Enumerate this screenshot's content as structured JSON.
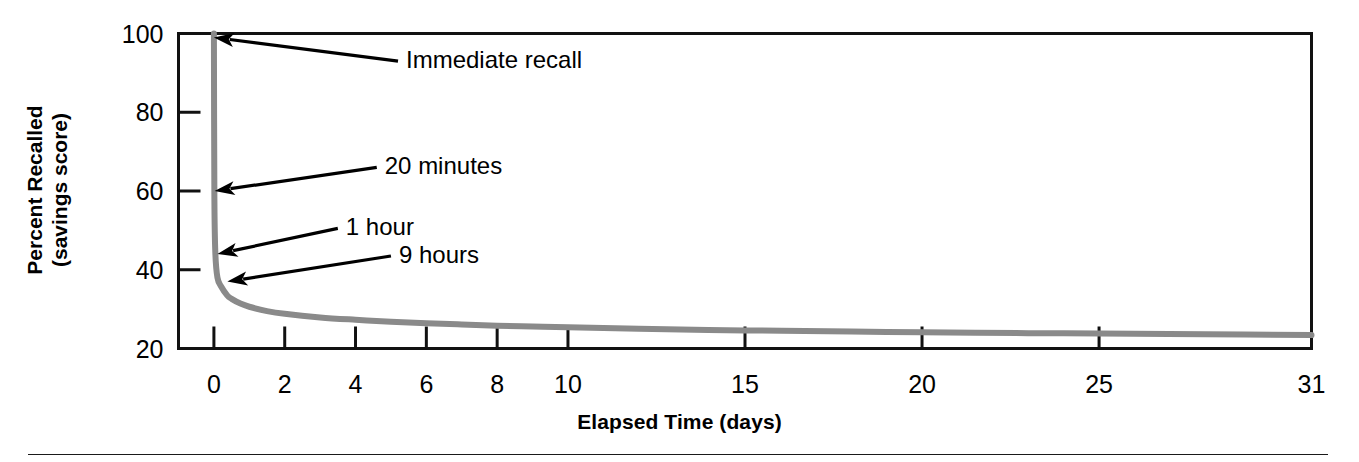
{
  "figure": {
    "name": "ebbinghaus-forgetting-curve",
    "background": "#ffffff",
    "axis_color": "#111111",
    "curve_color": "#8a8a8a",
    "annotation_color": "#000000"
  },
  "chart_data": {
    "type": "line",
    "title": "",
    "xlabel": "Elapsed Time (days)",
    "ylabel": "Percent Recalled\n(savings score)",
    "ylabel_line1": "Percent Recalled",
    "ylabel_line2": "(savings score)",
    "xlim": [
      -1,
      31
    ],
    "ylim": [
      20,
      100
    ],
    "grid": false,
    "legend": "none",
    "xticks": [
      0,
      2,
      4,
      6,
      8,
      10,
      15,
      20,
      25,
      31
    ],
    "xtick_labels": [
      "0",
      "2",
      "4",
      "6",
      "8",
      "10",
      "15",
      "20",
      "25",
      "31"
    ],
    "yticks": [
      20,
      40,
      60,
      80,
      100
    ],
    "ytick_labels": [
      "20",
      "40",
      "60",
      "80",
      "100"
    ],
    "series": [
      {
        "name": "Percent recalled (savings score)",
        "x": [
          0,
          0.0139,
          0.0417,
          0.1,
          0.2,
          0.375,
          0.5,
          0.75,
          1,
          1.5,
          2,
          3,
          4,
          5,
          6,
          7,
          8,
          9,
          10,
          12,
          15,
          18,
          20,
          23,
          25,
          28,
          31
        ],
        "values": [
          100,
          58,
          44,
          38,
          35.8,
          33.5,
          32.6,
          31.4,
          30.6,
          29.5,
          28.8,
          27.9,
          27.3,
          26.8,
          26.4,
          26.1,
          25.8,
          25.6,
          25.4,
          25.0,
          24.6,
          24.3,
          24.1,
          23.9,
          23.8,
          23.6,
          23.4
        ]
      }
    ],
    "annotations": [
      {
        "label": "Immediate recall",
        "x": 0.0,
        "y": 99,
        "text_x": 5.2,
        "text_y": 93
      },
      {
        "label": "20 minutes",
        "x": 0.02,
        "y": 60,
        "text_x": 4.6,
        "text_y": 66
      },
      {
        "label": "1 hour",
        "x": 0.1,
        "y": 44,
        "text_x": 3.5,
        "text_y": 50.5
      },
      {
        "label": "9 hours",
        "x": 0.38,
        "y": 37,
        "text_x": 5.0,
        "text_y": 43.5
      }
    ]
  },
  "footer": {
    "rule": "horizontal-divider"
  }
}
